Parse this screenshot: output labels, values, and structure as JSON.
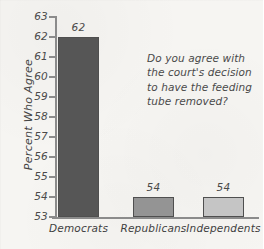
{
  "chart_data": {
    "type": "bar",
    "title": "",
    "subtitle": "",
    "xlabel": "",
    "ylabel": "Percent Who Agree",
    "categories": [
      "Democrats",
      "Republicans",
      "Independents"
    ],
    "values": [
      62,
      54,
      54
    ],
    "value_labels": [
      "62",
      "54",
      "54"
    ],
    "ylim": [
      53,
      63
    ],
    "y_ticks": [
      63,
      62,
      61,
      60,
      59,
      58,
      57,
      56,
      55,
      54,
      53
    ],
    "y_tick_labels": [
      "63",
      "62",
      "61",
      "60",
      "59",
      "58",
      "57",
      "56",
      "55",
      "54",
      "53"
    ],
    "grid": false,
    "legend": "none",
    "bar_colors": [
      "#565656",
      "#949494",
      "#c5c5c5"
    ],
    "bar_border_color": "#4f4f4f",
    "axis_color": "#8b8b8b",
    "background_color": "#f6f5f2",
    "text_color": "#4a4a4a",
    "annotation": {
      "text": "Do you agree with the court's decision to have the feeding tube removed?",
      "lines": [
        "Do you agree with",
        "the court's decision",
        "to have the feeding",
        "tube removed?"
      ],
      "position": "upper-right"
    }
  }
}
